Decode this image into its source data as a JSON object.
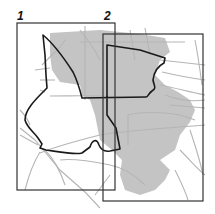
{
  "map": {
    "colors": {
      "background": "#ffffff",
      "shaded_area": "#c4c4c4",
      "roads": "#b5b5b5",
      "boundary": "#1a1a1a",
      "frames": "#333333"
    },
    "frames": [
      {
        "label": "1",
        "x": 17,
        "y": 23,
        "width": 98,
        "height": 167
      },
      {
        "label": "2",
        "x": 103,
        "y": 34,
        "width": 100,
        "height": 167
      }
    ]
  }
}
